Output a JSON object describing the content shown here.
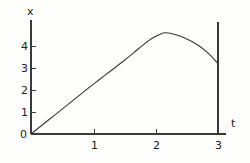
{
  "chart_data": {
    "type": "line",
    "title": "",
    "xlabel": "t",
    "ylabel": "x",
    "xlim": [
      0,
      3.15
    ],
    "ylim": [
      0,
      5.3
    ],
    "grid": false,
    "legend": null,
    "xticks": [
      {
        "value": 0,
        "label": "0"
      },
      {
        "value": 1,
        "label": "1"
      },
      {
        "value": 2,
        "label": "2"
      },
      {
        "value": 3,
        "label": "3"
      }
    ],
    "yticks": [
      {
        "value": 0,
        "label": "0"
      },
      {
        "value": 1,
        "label": "1"
      },
      {
        "value": 2,
        "label": "2"
      },
      {
        "value": 3,
        "label": "3"
      },
      {
        "value": 4,
        "label": "4"
      }
    ],
    "series": [
      {
        "name": "x(t)",
        "color": "#3a3a3a",
        "x": [
          0.0,
          0.15,
          0.3,
          0.45,
          0.6,
          0.75,
          0.9,
          1.05,
          1.2,
          1.35,
          1.5,
          1.65,
          1.8,
          1.95,
          2.1,
          2.15,
          2.25,
          2.4,
          2.55,
          2.7,
          2.85,
          3.0
        ],
        "y": [
          0.0,
          0.34,
          0.68,
          1.02,
          1.36,
          1.7,
          2.04,
          2.37,
          2.7,
          3.02,
          3.35,
          3.7,
          4.05,
          4.36,
          4.57,
          4.6,
          4.57,
          4.44,
          4.25,
          4.0,
          3.65,
          3.2
        ]
      }
    ],
    "annotations": [
      {
        "name": "terminal-vertical-line",
        "x": 3.0,
        "y_from": 0.0,
        "y_to": 5.08
      }
    ],
    "axis_color": "#3a3a3a"
  },
  "labels": {
    "y_axis_title": "x",
    "x_axis_title": "t"
  }
}
